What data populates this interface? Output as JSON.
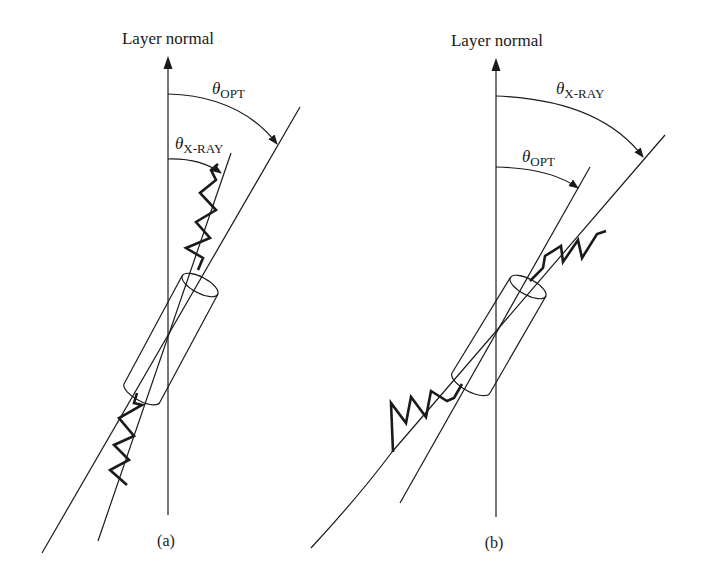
{
  "figure": {
    "panels": [
      {
        "id": "a",
        "caption": "(a)",
        "axis_label": "Layer normal",
        "outer_angle": {
          "symbol": "θ",
          "subscript": "OPT"
        },
        "inner_angle": {
          "symbol": "θ",
          "subscript": "X-RAY"
        },
        "note": "Optical axis tilted more than X-ray layer normal; zigzag chain along inner line"
      },
      {
        "id": "b",
        "caption": "(b)",
        "axis_label": "Layer normal",
        "outer_angle": {
          "symbol": "θ",
          "subscript": "X-RAY"
        },
        "inner_angle": {
          "symbol": "θ",
          "subscript": "OPT"
        },
        "note": "Zigzag chain along outer line; X-ray angle larger than optical angle"
      }
    ],
    "colors": {
      "stroke": "#1a1a1a",
      "background": "#ffffff"
    }
  }
}
